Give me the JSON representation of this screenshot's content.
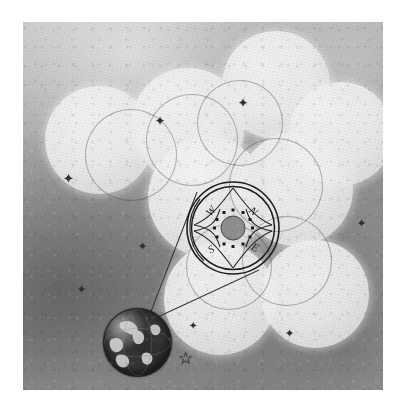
{
  "artwork": {
    "title": "Earth observing a cluster of spheres through a compass lens",
    "medium": "graphite pencil drawing",
    "canvas": {
      "width": 408,
      "height": 419,
      "margin_color": "#ffffff"
    },
    "background": {
      "base_color": "#9a9a9a",
      "light_color": "#c9c9c9",
      "dark_color": "#6a6a6a",
      "texture": "grainy-paper-shading"
    },
    "spheres": {
      "fill_color": "#efefef",
      "edge_color": "#cfcfcf",
      "items": [
        {
          "name": "sphere-upper-left",
          "cx": 76,
          "cy": 118,
          "r": 54
        },
        {
          "name": "sphere-upper-center",
          "cx": 165,
          "cy": 103,
          "r": 57
        },
        {
          "name": "sphere-top",
          "cx": 253,
          "cy": 63,
          "r": 54
        },
        {
          "name": "sphere-upper-right",
          "cx": 318,
          "cy": 112,
          "r": 52
        },
        {
          "name": "sphere-mid-right",
          "cx": 273,
          "cy": 167,
          "r": 57
        },
        {
          "name": "sphere-center",
          "cx": 185,
          "cy": 175,
          "r": 60
        },
        {
          "name": "sphere-lower-center",
          "cx": 197,
          "cy": 277,
          "r": 56
        },
        {
          "name": "sphere-lower-right",
          "cx": 292,
          "cy": 272,
          "r": 54
        }
      ]
    },
    "outline_rings": {
      "stroke_color": "#5a5a5a",
      "items": [
        {
          "name": "ring-left",
          "cx": 107,
          "cy": 132,
          "r": 45
        },
        {
          "name": "ring-upper-mid",
          "cx": 168,
          "cy": 117,
          "r": 45
        },
        {
          "name": "ring-upper-right",
          "cx": 216,
          "cy": 100,
          "r": 42
        },
        {
          "name": "ring-right",
          "cx": 252,
          "cy": 162,
          "r": 46
        },
        {
          "name": "ring-lower-right",
          "cx": 263,
          "cy": 238,
          "r": 44
        },
        {
          "name": "ring-lower-mid",
          "cx": 205,
          "cy": 244,
          "r": 42
        }
      ]
    },
    "stars": {
      "color": "#2f2f2f",
      "items": [
        {
          "name": "star-1",
          "x": 46,
          "y": 157,
          "size": 13
        },
        {
          "name": "star-2",
          "x": 138,
          "y": 100,
          "size": 12
        },
        {
          "name": "star-3",
          "x": 221,
          "y": 82,
          "size": 12
        },
        {
          "name": "star-4",
          "x": 121,
          "y": 225,
          "size": 11
        },
        {
          "name": "star-5",
          "x": 60,
          "y": 268,
          "size": 11
        },
        {
          "name": "star-6",
          "x": 340,
          "y": 203,
          "size": 11
        },
        {
          "name": "star-7",
          "x": 172,
          "y": 305,
          "size": 10
        },
        {
          "name": "star-8",
          "x": 268,
          "y": 313,
          "size": 11
        },
        {
          "name": "star-9",
          "x": 163,
          "y": 337,
          "size": 16
        }
      ]
    },
    "compass": {
      "name": "compass-rose",
      "cx": 210,
      "cy": 206,
      "outer_r": 46,
      "inner_r": 41,
      "hub_r": 12,
      "stroke_color": "#1d1d1d",
      "hub_color": "#8f8f8f",
      "dot_color": "#1d1d1d",
      "dot_count": 12,
      "directions": [
        {
          "label": "W",
          "position": "top-left"
        },
        {
          "label": "N",
          "position": "top-right"
        },
        {
          "label": "S",
          "position": "bottom-left"
        },
        {
          "label": "E",
          "position": "bottom-right"
        }
      ]
    },
    "earth": {
      "name": "earth-globe",
      "cx": 114,
      "cy": 320,
      "r": 34,
      "ocean_color": "#2a2a2a",
      "land_color": "#d8d8d8",
      "outline_color": "#1a1a1a"
    },
    "beam": {
      "name": "sight-beam",
      "origin": {
        "x": 124,
        "y": 300
      },
      "stroke_color": "#3a3a3a",
      "edge_a": {
        "x": 172,
        "y": 172
      },
      "edge_b": {
        "x": 234,
        "y": 246
      }
    }
  }
}
